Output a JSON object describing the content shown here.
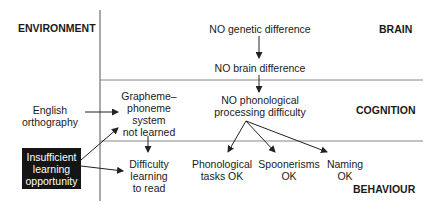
{
  "headers": {
    "environment": "ENVIRONMENT",
    "brain": "BRAIN",
    "cognition": "COGNITION",
    "behaviour": "BEHAVIOUR"
  },
  "nodes": {
    "no_genetic": "NO genetic difference",
    "no_brain": "NO brain difference",
    "no_phon_1": "NO phonological",
    "no_phon_2": "processing difficulty",
    "english_1": "English",
    "english_2": "orthography",
    "gp_1": "Grapheme–",
    "gp_2": "phoneme",
    "gp_3": "system",
    "gp_4": "not learned",
    "insufficient_1": "Insufficient",
    "insufficient_2": "learning",
    "insufficient_3": "opportunity",
    "difficulty_1": "Difficulty",
    "difficulty_2": "learning",
    "difficulty_3": "to read",
    "phon_tasks_1": "Phonological",
    "phon_tasks_2": "tasks OK",
    "spoon_1": "Spoonerisms",
    "spoon_2": "OK",
    "naming_1": "Naming",
    "naming_2": "OK"
  },
  "colors": {
    "line": "#333333",
    "divider": "#888888",
    "box_fill": "#151515",
    "box_text": "#ffffff"
  }
}
